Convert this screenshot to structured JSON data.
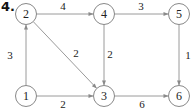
{
  "problem_number": "4.",
  "colors": {
    "edge": "#9a9a9a",
    "node_border": "#888888",
    "text": "#222222"
  },
  "nodes": [
    {
      "id": "1",
      "label": "1"
    },
    {
      "id": "2",
      "label": "2"
    },
    {
      "id": "3",
      "label": "3"
    },
    {
      "id": "4",
      "label": "4"
    },
    {
      "id": "5",
      "label": "5"
    },
    {
      "id": "6",
      "label": "6"
    }
  ],
  "edges": [
    {
      "from": "1",
      "to": "2",
      "weight": "3"
    },
    {
      "from": "1",
      "to": "3",
      "weight": "2"
    },
    {
      "from": "2",
      "to": "4",
      "weight": "4"
    },
    {
      "from": "2",
      "to": "3",
      "weight": "2"
    },
    {
      "from": "4",
      "to": "3",
      "weight": "2"
    },
    {
      "from": "4",
      "to": "5",
      "weight": "3"
    },
    {
      "from": "5",
      "to": "6",
      "weight": "1"
    },
    {
      "from": "3",
      "to": "6",
      "weight": "6"
    }
  ]
}
